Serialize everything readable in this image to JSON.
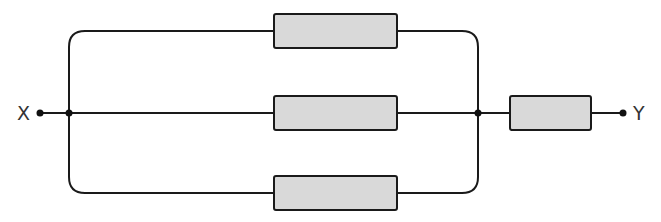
{
  "diagram": {
    "type": "circuit",
    "terminals": {
      "left": "X",
      "right": "Y"
    },
    "components": [
      {
        "id": "R1",
        "kind": "resistor",
        "position": "top-parallel-branch"
      },
      {
        "id": "R2",
        "kind": "resistor",
        "position": "middle-parallel-branch"
      },
      {
        "id": "R3",
        "kind": "resistor",
        "position": "bottom-parallel-branch"
      },
      {
        "id": "R4",
        "kind": "resistor",
        "position": "series-after-parallel"
      }
    ],
    "colors": {
      "wire": "#1a1a1a",
      "resistor_fill": "#d9d9d9",
      "resistor_stroke": "#1a1a1a",
      "label": "#333333"
    }
  }
}
